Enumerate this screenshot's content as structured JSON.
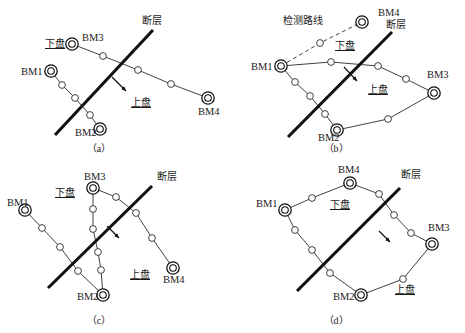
{
  "figure": {
    "width": 465,
    "height": 333,
    "colors": {
      "background": "#ffffff",
      "fault": "#111111",
      "network": "#2b2b2b",
      "text": "#1a1a1a"
    }
  },
  "labels": {
    "fault": "断层",
    "footwall": "下盘",
    "hangingwall": "上盘",
    "survey_route": "检测路线",
    "bm1": "BM1",
    "bm2": "BM2",
    "bm3": "BM3",
    "bm4": "BM4"
  },
  "panels": [
    {
      "id": "a",
      "caption": "（a）",
      "benchmarks": [
        "BM1",
        "BM2",
        "BM3",
        "BM4"
      ],
      "annotations": [
        "断层",
        "下盘",
        "上盘"
      ],
      "has_dashed_route": false,
      "bm_positions": {
        "BM1": [
          51,
          71
        ],
        "BM2": [
          100,
          129
        ],
        "BM3": [
          72,
          44
        ],
        "BM4": [
          208,
          98
        ]
      },
      "label_positions": {
        "BM1": [
          21,
          75
        ],
        "BM2": [
          75,
          136
        ],
        "BM3": [
          82,
          41
        ],
        "BM4": [
          198,
          115
        ],
        "断层": [
          142,
          24
        ],
        "下盘": [
          45,
          47
        ],
        "上盘": [
          131,
          106
        ]
      },
      "fault": [
        [
          55,
          135
        ],
        [
          153,
          30
        ]
      ],
      "arrow": [
        [
          112,
          77
        ],
        [
          126,
          91
        ]
      ],
      "chains": [
        {
          "from": "BM1",
          "to": "BM2",
          "mids": [
            [
              62,
              85
            ],
            [
              75,
              98
            ],
            [
              90,
              115
            ]
          ]
        },
        {
          "from": "BM3",
          "to": "BM4",
          "mids": [
            [
              103,
              56
            ],
            [
              138,
              70
            ],
            [
              171,
              84
            ]
          ]
        }
      ]
    },
    {
      "id": "b",
      "caption": "（b）",
      "benchmarks": [
        "BM1",
        "BM2",
        "BM3",
        "BM4"
      ],
      "annotations": [
        "断层",
        "下盘",
        "上盘",
        "检测路线"
      ],
      "has_dashed_route": true,
      "bm_positions": {
        "BM1": [
          281,
          66
        ],
        "BM2": [
          337,
          130
        ],
        "BM3": [
          434,
          93
        ],
        "BM4": [
          362,
          22
        ]
      },
      "label_positions": {
        "BM1": [
          251,
          70
        ],
        "BM2": [
          318,
          141
        ],
        "BM3": [
          427,
          78
        ],
        "BM4": [
          378,
          16
        ],
        "断层": [
          386,
          28
        ],
        "下盘": [
          335,
          49
        ],
        "上盘": [
          368,
          93
        ],
        "检测路线": [
          283,
          24
        ]
      },
      "fault": [
        [
          288,
          137
        ],
        [
          392,
          32
        ]
      ],
      "arrow": [
        [
          344,
          67
        ],
        [
          357,
          81
        ]
      ],
      "chains": [
        {
          "from": "BM1",
          "to": "BM4",
          "mids": [
            [
              320,
              43
            ]
          ],
          "dashed": true
        },
        {
          "from": "BM1",
          "to": "BM3",
          "mids": [
            [
              331,
              62
            ],
            [
              378,
              66
            ],
            [
              406,
              79
            ]
          ]
        },
        {
          "from": "BM1",
          "to": "BM2",
          "mids": [
            [
              295,
              82
            ],
            [
              310,
              96
            ],
            [
              325,
              114
            ]
          ]
        },
        {
          "from": "BM2",
          "to": "BM3",
          "mids": [
            [
              388,
              119
            ]
          ]
        }
      ]
    },
    {
      "id": "c",
      "caption": "（c）",
      "benchmarks": [
        "BM1",
        "BM2",
        "BM3",
        "BM4"
      ],
      "annotations": [
        "断层",
        "下盘",
        "上盘"
      ],
      "has_dashed_route": false,
      "bm_positions": {
        "BM1": [
          25,
          210
        ],
        "BM2": [
          103,
          295
        ],
        "BM3": [
          93,
          188
        ],
        "BM4": [
          173,
          268
        ]
      },
      "label_positions": {
        "BM1": [
          7,
          206
        ],
        "BM2": [
          77,
          300
        ],
        "BM3": [
          84,
          180
        ],
        "BM4": [
          163,
          283
        ],
        "断层": [
          157,
          180
        ],
        "下盘": [
          55,
          196
        ],
        "上盘": [
          130,
          278
        ]
      },
      "fault": [
        [
          48,
          288
        ],
        [
          152,
          186
        ]
      ],
      "arrow": [
        [
          107,
          226
        ],
        [
          119,
          238
        ]
      ],
      "chains": [
        {
          "from": "BM1",
          "to": "BM2",
          "mids": [
            [
              42,
              228
            ],
            [
              60,
              247
            ],
            [
              78,
              271
            ]
          ]
        },
        {
          "from": "BM3",
          "to": "BM2",
          "mids": [
            [
              93,
              209
            ],
            [
              93,
              229
            ],
            [
              98,
              252
            ],
            [
              101,
              270
            ]
          ]
        },
        {
          "from": "BM3",
          "to": "BM4",
          "mids": [
            [
              116,
              197
            ],
            [
              136,
              213
            ],
            [
              152,
              238
            ]
          ]
        }
      ]
    },
    {
      "id": "d",
      "caption": "（d）",
      "benchmarks": [
        "BM1",
        "BM2",
        "BM3",
        "BM4"
      ],
      "annotations": [
        "断层",
        "下盘",
        "上盘"
      ],
      "has_dashed_route": false,
      "bm_positions": {
        "BM1": [
          285,
          210
        ],
        "BM2": [
          361,
          295
        ],
        "BM3": [
          432,
          244
        ],
        "BM4": [
          350,
          183
        ]
      },
      "label_positions": {
        "BM1": [
          256,
          207
        ],
        "BM2": [
          333,
          300
        ],
        "BM3": [
          428,
          231
        ],
        "BM4": [
          338,
          173
        ],
        "断层": [
          401,
          178
        ],
        "下盘": [
          330,
          208
        ]
      },
      "fault": [
        [
          297,
          291
        ],
        [
          400,
          188
        ]
      ],
      "arrow": [
        [
          379,
          231
        ],
        [
          390,
          242
        ]
      ],
      "chains": [
        {
          "from": "BM1",
          "to": "BM4",
          "mids": [
            [
              312,
              198
            ]
          ]
        },
        {
          "from": "BM1",
          "to": "BM2",
          "mids": [
            [
              295,
              230
            ],
            [
              312,
              250
            ],
            [
              330,
              273
            ]
          ]
        },
        {
          "from": "BM4",
          "to": "BM3",
          "mids": [
            [
              379,
              194
            ],
            [
              394,
              215
            ],
            [
              411,
              233
            ]
          ]
        },
        {
          "from": "BM2",
          "to": "BM3",
          "mids": [
            [
              403,
              279
            ]
          ]
        }
      ],
      "hangingwall_label_position": [
        395,
        293
      ]
    }
  ]
}
